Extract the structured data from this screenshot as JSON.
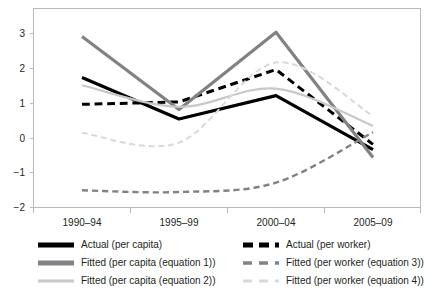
{
  "chart_data": {
    "type": "line",
    "title": "",
    "xlabel": "",
    "ylabel": "",
    "categories": [
      "1990–94",
      "1995–99",
      "2000–04",
      "2005–09"
    ],
    "ylim": [
      -2,
      3
    ],
    "yticks": [
      3,
      2,
      1,
      0,
      -1,
      -2
    ],
    "ytick_labels": [
      "3",
      "2",
      "1",
      "0",
      "−1",
      "−2"
    ],
    "grid": false,
    "legend_position": "below-plot",
    "series": [
      {
        "name": "Actual (per capita)",
        "values": [
          1.72,
          0.53,
          1.2,
          -0.35
        ],
        "color": "#000000",
        "style": "solid",
        "width": 3.2,
        "smooth": false
      },
      {
        "name": "Actual (per worker)",
        "values": [
          0.95,
          1.02,
          1.95,
          -0.2
        ],
        "color": "#000000",
        "style": "dashed",
        "width": 3.0,
        "smooth": false
      },
      {
        "name": "Fitted (per capita (equation 1))",
        "values": [
          2.9,
          0.8,
          3.02,
          -0.58
        ],
        "color": "#808285",
        "style": "solid",
        "width": 3.2,
        "smooth": false
      },
      {
        "name": "Fitted (per worker (equation 3))",
        "values": [
          -1.52,
          -1.57,
          -1.3,
          0.15
        ],
        "color": "#808285",
        "style": "dashed",
        "width": 2.4,
        "smooth": true
      },
      {
        "name": "Fitted (per capita (equation 2))",
        "values": [
          1.5,
          0.88,
          1.4,
          0.33
        ],
        "color": "#c7c8ca",
        "style": "solid",
        "width": 2.2,
        "smooth": true
      },
      {
        "name": "Fitted (per worker (equation 4))",
        "values": [
          0.13,
          -0.15,
          2.15,
          0.62
        ],
        "color": "#d8d9da",
        "style": "dashed",
        "width": 2.0,
        "smooth": true
      }
    ]
  },
  "axes": {
    "ytick_0": "3",
    "ytick_1": "2",
    "ytick_2": "1",
    "ytick_3": "0",
    "ytick_4": "−1",
    "ytick_5": "−2",
    "xtick_0": "1990–94",
    "xtick_1": "1995–99",
    "xtick_2": "2000–04",
    "xtick_3": "2005–09"
  },
  "legend": {
    "left_column": [
      {
        "label": "Actual (per capita)",
        "swatch": "solid-black-thick",
        "color": "#000000"
      },
      {
        "label": "Fitted (per capita (equation 1))",
        "swatch": "solid-gray-thick",
        "color": "#808285"
      },
      {
        "label": "Fitted (per capita (equation 2))",
        "swatch": "solid-lightgray",
        "color": "#c7c8ca"
      }
    ],
    "right_column": [
      {
        "label": "Actual (per worker)",
        "swatch": "dashed-black-thick",
        "color": "#000000"
      },
      {
        "label": "Fitted (per worker (equation 3))",
        "swatch": "dashed-gray",
        "color": "#808285"
      },
      {
        "label": "Fitted (per worker (equation 4))",
        "swatch": "dashed-lightgray",
        "color": "#d8d9da"
      }
    ]
  },
  "colors": {
    "black": "#000000",
    "dark_gray": "#808285",
    "mid_gray": "#c7c8ca",
    "light_gray": "#d8d9da",
    "axis": "#b9b9b9",
    "text": "#231f20",
    "background": "#ffffff"
  }
}
